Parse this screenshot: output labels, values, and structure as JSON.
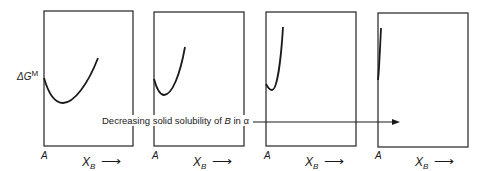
{
  "figure": {
    "y_axis_label": {
      "main": "ΔG",
      "superscript": "M"
    },
    "caption": {
      "prefix": "Decreasing solid solubility of ",
      "species": "B",
      "middle": " in ",
      "phase": "α"
    },
    "panels": [
      {
        "origin_label": "A",
        "x_label_main": "X",
        "x_label_sub": "B",
        "x_arrow": "⟶"
      },
      {
        "origin_label": "A",
        "x_label_main": "X",
        "x_label_sub": "B",
        "x_arrow": "⟶"
      },
      {
        "origin_label": "A",
        "x_label_main": "X",
        "x_label_sub": "B",
        "x_arrow": "⟶"
      },
      {
        "origin_label": "A",
        "x_label_main": "X",
        "x_label_sub": "B",
        "x_arrow": "⟶"
      }
    ],
    "line_color": "#1a1a1a"
  }
}
